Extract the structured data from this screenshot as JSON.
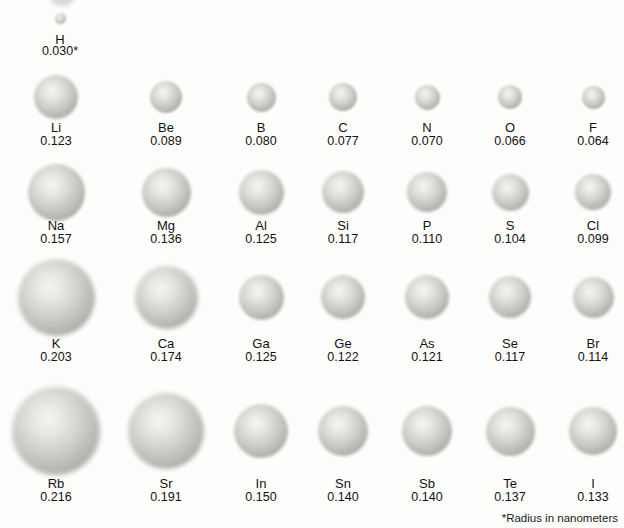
{
  "figure": {
    "footnote": "*Radius in nanometers"
  },
  "chart_data": {
    "type": "bubble",
    "unit": "nanometers",
    "note": "*Radius in nanometers",
    "rows": [
      {
        "elements": [
          {
            "symbol": "H",
            "radius_nm": 0.03,
            "label": "0.030*"
          }
        ]
      },
      {
        "elements": [
          {
            "symbol": "Li",
            "radius_nm": 0.123,
            "label": "0.123"
          },
          {
            "symbol": "Be",
            "radius_nm": 0.089,
            "label": "0.089"
          },
          {
            "symbol": "B",
            "radius_nm": 0.08,
            "label": "0.080"
          },
          {
            "symbol": "C",
            "radius_nm": 0.077,
            "label": "0.077"
          },
          {
            "symbol": "N",
            "radius_nm": 0.07,
            "label": "0.070"
          },
          {
            "symbol": "O",
            "radius_nm": 0.066,
            "label": "0.066"
          },
          {
            "symbol": "F",
            "radius_nm": 0.064,
            "label": "0.064"
          }
        ]
      },
      {
        "elements": [
          {
            "symbol": "Na",
            "radius_nm": 0.157,
            "label": "0.157"
          },
          {
            "symbol": "Mg",
            "radius_nm": 0.136,
            "label": "0.136"
          },
          {
            "symbol": "Al",
            "radius_nm": 0.125,
            "label": "0.125"
          },
          {
            "symbol": "Si",
            "radius_nm": 0.117,
            "label": "0.117"
          },
          {
            "symbol": "P",
            "radius_nm": 0.11,
            "label": "0.110"
          },
          {
            "symbol": "S",
            "radius_nm": 0.104,
            "label": "0.104"
          },
          {
            "symbol": "Cl",
            "radius_nm": 0.099,
            "label": "0.099"
          }
        ]
      },
      {
        "elements": [
          {
            "symbol": "K",
            "radius_nm": 0.203,
            "label": "0.203"
          },
          {
            "symbol": "Ca",
            "radius_nm": 0.174,
            "label": "0.174"
          },
          {
            "symbol": "Ga",
            "radius_nm": 0.125,
            "label": "0.125"
          },
          {
            "symbol": "Ge",
            "radius_nm": 0.122,
            "label": "0.122"
          },
          {
            "symbol": "As",
            "radius_nm": 0.121,
            "label": "0.121"
          },
          {
            "symbol": "Se",
            "radius_nm": 0.117,
            "label": "0.117"
          },
          {
            "symbol": "Br",
            "radius_nm": 0.114,
            "label": "0.114"
          }
        ]
      },
      {
        "elements": [
          {
            "symbol": "Rb",
            "radius_nm": 0.216,
            "label": "0.216"
          },
          {
            "symbol": "Sr",
            "radius_nm": 0.191,
            "label": "0.191"
          },
          {
            "symbol": "In",
            "radius_nm": 0.15,
            "label": "0.150"
          },
          {
            "symbol": "Sn",
            "radius_nm": 0.14,
            "label": "0.140"
          },
          {
            "symbol": "Sb",
            "radius_nm": 0.14,
            "label": "0.140"
          },
          {
            "symbol": "Te",
            "radius_nm": 0.137,
            "label": "0.137"
          },
          {
            "symbol": "I",
            "radius_nm": 0.133,
            "label": "0.133"
          }
        ]
      }
    ]
  }
}
